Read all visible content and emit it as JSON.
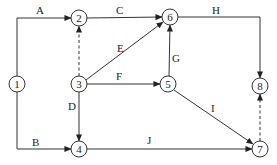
{
  "diagram": {
    "type": "activity-on-arrow network",
    "nodes": [
      {
        "id": "1",
        "label": "1",
        "x": 17,
        "y": 84
      },
      {
        "id": "2",
        "label": "2",
        "x": 79,
        "y": 18
      },
      {
        "id": "3",
        "label": "3",
        "x": 79,
        "y": 84
      },
      {
        "id": "4",
        "label": "4",
        "x": 79,
        "y": 149
      },
      {
        "id": "5",
        "label": "5",
        "x": 168,
        "y": 84
      },
      {
        "id": "6",
        "label": "6",
        "x": 170,
        "y": 17
      },
      {
        "id": "7",
        "label": "7",
        "x": 260,
        "y": 149
      },
      {
        "id": "8",
        "label": "8",
        "x": 260,
        "y": 86
      }
    ],
    "edges": [
      {
        "id": "A",
        "label": "A",
        "from": "1",
        "to": "2",
        "style": "solid"
      },
      {
        "id": "B",
        "label": "B",
        "from": "1",
        "to": "4",
        "style": "solid"
      },
      {
        "id": "C",
        "label": "C",
        "from": "2",
        "to": "6",
        "style": "solid"
      },
      {
        "id": "D",
        "label": "D",
        "from": "3",
        "to": "4",
        "style": "solid"
      },
      {
        "id": "E",
        "label": "E",
        "from": "3",
        "to": "6",
        "style": "solid"
      },
      {
        "id": "F",
        "label": "F",
        "from": "3",
        "to": "5",
        "style": "solid"
      },
      {
        "id": "G",
        "label": "G",
        "from": "5",
        "to": "6",
        "style": "solid"
      },
      {
        "id": "H",
        "label": "H",
        "from": "6",
        "to": "8",
        "style": "solid"
      },
      {
        "id": "I",
        "label": "I",
        "from": "5",
        "to": "7",
        "style": "solid"
      },
      {
        "id": "J",
        "label": "J",
        "from": "4",
        "to": "7",
        "style": "solid"
      },
      {
        "id": "dummy-3-2",
        "label": "",
        "from": "3",
        "to": "2",
        "style": "dashed"
      },
      {
        "id": "dummy-7-8",
        "label": "",
        "from": "7",
        "to": "8",
        "style": "dashed"
      }
    ]
  },
  "labels": {
    "A": "A",
    "B": "B",
    "C": "C",
    "D": "D",
    "E": "E",
    "F": "F",
    "G": "G",
    "H": "H",
    "I": "I",
    "J": "J",
    "n1": "1",
    "n2": "2",
    "n3": "3",
    "n4": "4",
    "n5": "5",
    "n6": "6",
    "n7": "7",
    "n8": "8"
  },
  "colors": {
    "line": "#333333",
    "background": "#ffffff"
  }
}
